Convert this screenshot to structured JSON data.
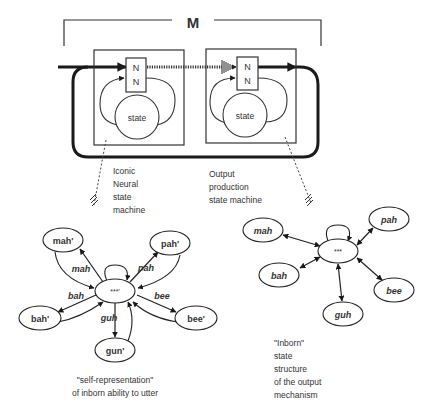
{
  "top": {
    "bracket_label": "M",
    "left_machine": {
      "nn_top": "N",
      "nn_bottom": "N",
      "state": "state"
    },
    "right_machine": {
      "nn_top": "N",
      "nn_bottom": "N",
      "state": "state"
    },
    "left_caption": [
      "Iconic",
      "Neural",
      "state",
      "machine"
    ],
    "right_caption": [
      "Output",
      "production",
      "state machine"
    ]
  },
  "left_graph": {
    "center": "***'",
    "nodes": {
      "mah": "mah'",
      "pah": "pah'",
      "bah": "bah'",
      "bee": "bee'",
      "gun": "gun'"
    },
    "edges": {
      "mah": "mah",
      "pah": "pah",
      "bah": "bah",
      "bee": "bee",
      "guh": "guh"
    },
    "caption": [
      "\"self-representation\"",
      "of inborn ability to utter"
    ]
  },
  "right_graph": {
    "center": "***",
    "nodes": {
      "mah": "mah",
      "pah": "pah",
      "bah": "bah",
      "bee": "bee",
      "guh": "guh"
    },
    "caption": [
      "\"Inborn\"",
      "state",
      "structure",
      "of the output",
      "mechanism"
    ]
  },
  "colors": {
    "ink": "#1a1a1a",
    "text": "#333333",
    "background": "#ffffff"
  }
}
